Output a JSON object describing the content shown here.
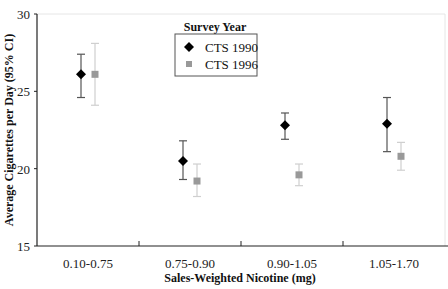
{
  "chart_data": {
    "type": "scatter",
    "subtype": "dot-plot-with-error-bars",
    "title": "",
    "xlabel": "Sales-Weighted Nicotine (mg)",
    "ylabel": "Average Cigarettes per Day (95% CI)",
    "ylim": [
      15,
      30
    ],
    "yticks": [
      15,
      20,
      25,
      30
    ],
    "grid": false,
    "categories": [
      "0.10-0.75",
      "0.75-0.90",
      "0.90-1.05",
      "1.05-1.70"
    ],
    "legend": {
      "title": "Survey Year",
      "position": "top-center"
    },
    "series": [
      {
        "name": "CTS 1990",
        "marker": "diamond",
        "color": "#000000",
        "values": [
          26.1,
          20.5,
          22.8,
          22.9
        ],
        "ci_lower": [
          24.6,
          19.3,
          21.9,
          21.1
        ],
        "ci_upper": [
          27.4,
          21.8,
          23.6,
          24.6
        ]
      },
      {
        "name": "CTS 1996",
        "marker": "square",
        "color": "#999999",
        "values": [
          26.1,
          19.2,
          19.6,
          20.8
        ],
        "ci_lower": [
          24.1,
          18.2,
          18.9,
          19.9
        ],
        "ci_upper": [
          28.1,
          20.3,
          20.3,
          21.7
        ]
      }
    ]
  }
}
